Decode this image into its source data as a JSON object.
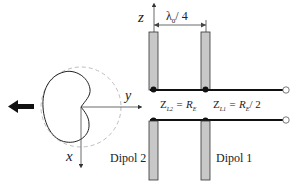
{
  "diagram": {
    "axes": {
      "z_label": "z",
      "y_label": "y",
      "x_label": "x"
    },
    "dimension": {
      "spacing_label_main": "λ",
      "spacing_label_sub": "0",
      "spacing_label_tail": "/ 4"
    },
    "impedances": {
      "zl2_main": "Z",
      "zl2_sub": "L2",
      "zl2_eq": "= R",
      "zl2_eq_sub": "E",
      "zl1_main": "Z",
      "zl1_sub": "L1",
      "zl1_eq": "= R",
      "zl1_eq_sub": "E",
      "zl1_tail": "/ 2"
    },
    "dipoles": [
      {
        "label": "Dipol 2"
      },
      {
        "label": "Dipol 1"
      }
    ],
    "radiation_pattern": {
      "shape": "cardioid",
      "direction": "-y"
    },
    "colors": {
      "line": "#111111",
      "dipole_fill": "#c8c8c8",
      "dipole_stroke": "#333333",
      "dashed_circle": "#bdbdbd"
    }
  }
}
